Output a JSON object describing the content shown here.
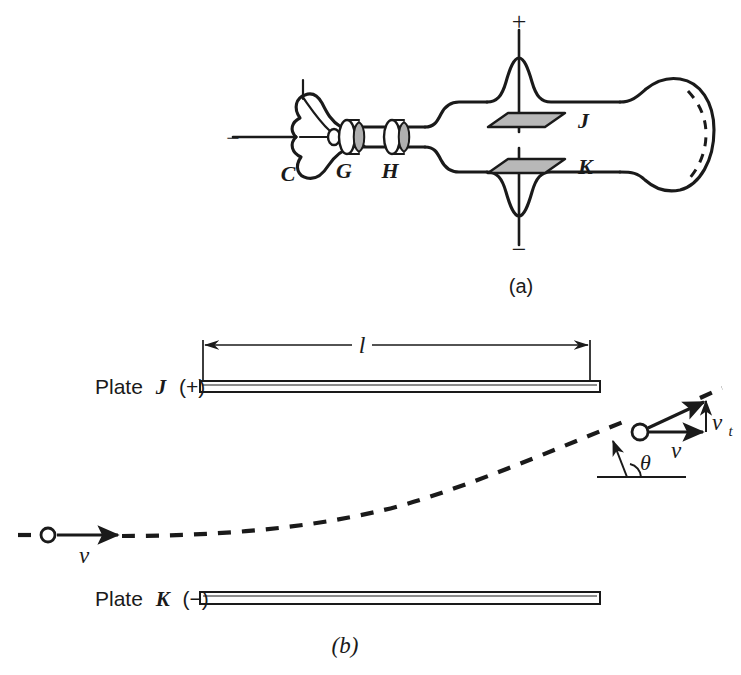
{
  "figure": {
    "caption_a": "(a)",
    "caption_b": "(b)",
    "background_color": "#ffffff",
    "ink_color": "#1a1a1a",
    "plate_fill_color": "#b8b8b8"
  },
  "panel_a": {
    "title": "Cathode ray tube schematic",
    "cathode_label": "C",
    "grid_label": "G",
    "anode_label": "H",
    "plate_j_label": "J",
    "plate_k_label": "K",
    "terminal_negative_left": "−",
    "terminal_positive_top": "+",
    "terminal_negative_bottom": "−",
    "caption": "(a)"
  },
  "panel_b": {
    "title": "Electron deflection between parallel plates",
    "plate_top_label": "Plate",
    "plate_top_name": "J",
    "plate_top_sign": "(+)",
    "plate_bottom_label": "Plate",
    "plate_bottom_name": "K",
    "plate_bottom_sign": "(−)",
    "length_label": "l",
    "velocity_in_label": "v",
    "velocity_out_label": "v",
    "velocity_transverse_label": "v",
    "velocity_transverse_sub": "t",
    "angle_label": "θ",
    "caption": "(b)"
  }
}
